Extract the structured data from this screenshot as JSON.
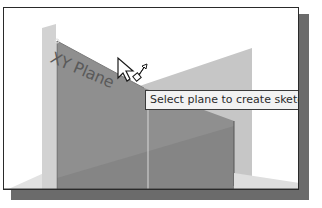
{
  "viewport": {
    "plane_label": "XY Plane",
    "tooltip_text": "Select plane to create sketch or"
  },
  "icons": {
    "cursor": "select-plane-cursor-icon"
  },
  "colors": {
    "background": "#ffffff",
    "front_plane": "#8e8e8e",
    "back_plane": "#c4c4c4",
    "shadow": "#6b6b6b",
    "border": "#2a2a2a",
    "tooltip_bg": "#f2f2f2"
  }
}
